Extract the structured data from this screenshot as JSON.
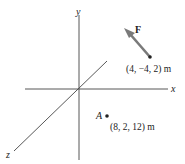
{
  "diagram": {
    "axes": {
      "x_label": "x",
      "y_label": "y",
      "z_label": "z"
    },
    "force": {
      "label": "F",
      "tail_point": "(4, −4, 2) m",
      "color": "#7a7a7a"
    },
    "point_A": {
      "label": "A",
      "coordinates": "(8, 2, 12) m"
    },
    "colors": {
      "axis": "#444444",
      "text": "#222222",
      "arrow": "#7a7a7a",
      "point": "#222222"
    }
  }
}
